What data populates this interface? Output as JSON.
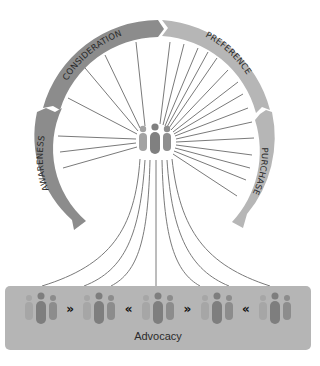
{
  "diagram": {
    "stages": [
      {
        "label": "AWARENESS",
        "color": "#8c8c8c"
      },
      {
        "label": "CONSIDERATION",
        "color": "#8c8c8c"
      },
      {
        "label": "PREFERENCE",
        "color": "#b6b6b6"
      },
      {
        "label": "PURCHASE",
        "color": "#b6b6b6"
      }
    ],
    "center_icon": "people-group-icon",
    "advocacy": {
      "label": "Advocacy",
      "background": "#b5b5b5",
      "sequence": [
        "people",
        "»",
        "people",
        "«",
        "people",
        "»",
        "people",
        "«",
        "people"
      ]
    },
    "colors": {
      "ring_dark": "#8c8c8c",
      "ring_light": "#b6b6b6",
      "spoke": "#7a7a7a",
      "people_light": "#a8a8a8",
      "people_dark": "#7e7e7e"
    }
  }
}
